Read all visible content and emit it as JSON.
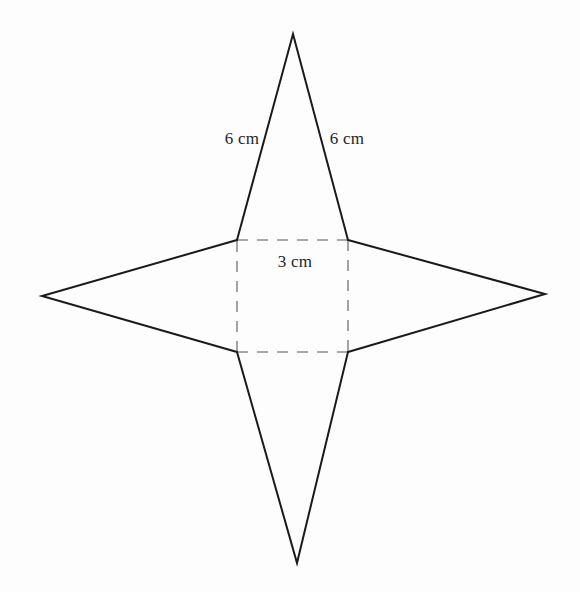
{
  "figure": {
    "background_color": "#fdfdfd",
    "solid_stroke_color": "#1a1a1a",
    "dashed_stroke_color": "#8c8c8c",
    "solid_stroke_width": 2,
    "dashed_stroke_width": 1.6,
    "dash_pattern": "11 9",
    "canvas": {
      "width": 580,
      "height": 592
    }
  },
  "square": {
    "name": "base-square",
    "side_label": "3 cm",
    "corners": {
      "top_left": {
        "x": 237,
        "y": 240
      },
      "top_right": {
        "x": 348,
        "y": 240
      },
      "bottom_right": {
        "x": 348,
        "y": 352
      },
      "bottom_left": {
        "x": 237,
        "y": 352
      }
    }
  },
  "triangles": [
    {
      "name": "top-triangle",
      "apex": {
        "x": 293,
        "y": 34
      },
      "base_left": {
        "x": 237,
        "y": 240
      },
      "base_right": {
        "x": 348,
        "y": 240
      }
    },
    {
      "name": "bottom-triangle",
      "apex": {
        "x": 297,
        "y": 563
      },
      "base_left": {
        "x": 237,
        "y": 352
      },
      "base_right": {
        "x": 348,
        "y": 352
      }
    },
    {
      "name": "left-triangle",
      "apex": {
        "x": 42,
        "y": 296
      },
      "base_left": {
        "x": 237,
        "y": 240
      },
      "base_right": {
        "x": 237,
        "y": 352
      }
    },
    {
      "name": "right-triangle",
      "apex": {
        "x": 545,
        "y": 294
      },
      "base_left": {
        "x": 348,
        "y": 240
      },
      "base_right": {
        "x": 348,
        "y": 352
      }
    }
  ],
  "labels": [
    {
      "name": "slant-length-left",
      "text": "6 cm",
      "x": 242,
      "y": 138
    },
    {
      "name": "slant-length-right",
      "text": "6 cm",
      "x": 347,
      "y": 138
    },
    {
      "name": "base-length",
      "text": "3 cm",
      "x": 295,
      "y": 261
    }
  ]
}
